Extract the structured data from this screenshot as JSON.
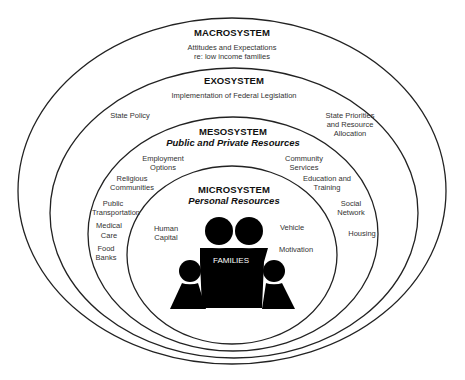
{
  "diagram": {
    "type": "nested-ellipses",
    "levels": [
      {
        "key": "macrosystem",
        "title": "MACROSYSTEM",
        "subtitle": "",
        "items": [
          "Attitudes and Expectations",
          "re: low income families"
        ]
      },
      {
        "key": "exosystem",
        "title": "EXOSYSTEM",
        "subtitle": "",
        "items": [
          "Implementation of Federal Legislation",
          "State Policy",
          "State Priorities",
          "and Resource",
          "Allocation"
        ]
      },
      {
        "key": "mesosystem",
        "title": "MESOSYSTEM",
        "subtitle": "Public and Private Resources",
        "items": [
          "Employment",
          "Options",
          "Religious",
          "Communities",
          "Public",
          "Transportation",
          "Medical",
          "Care",
          "Food",
          "Banks",
          "Community",
          "Services",
          "Education and",
          "Training",
          "Social",
          "Network",
          "Housing"
        ]
      },
      {
        "key": "microsystem",
        "title": "MICROSYSTEM",
        "subtitle": "Personal Resources",
        "items": [
          "Human",
          "Capital",
          "Vehicle",
          "Motivation"
        ]
      }
    ],
    "center": {
      "label": "FAMILIES",
      "icon": "family-icon"
    },
    "colors": {
      "line": "#222222",
      "figure": "#000000",
      "background": "#ffffff"
    }
  }
}
